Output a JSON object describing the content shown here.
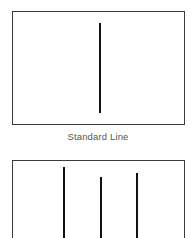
{
  "figure": {
    "width": 196,
    "height": 238,
    "background_color": "#ffffff",
    "line_color": "#111111",
    "frame_color": "#3a3a3c",
    "caption_color": "#555558"
  },
  "panels": [
    {
      "id": "standard",
      "caption": "Standard Line",
      "frame": {
        "x": 12,
        "y": 11,
        "width": 173,
        "height": 114
      },
      "marks": [
        {
          "name": "line-1",
          "x": 98,
          "y_top": 22,
          "y_bottom": 112,
          "thickness": 2
        }
      ]
    },
    {
      "id": "variant",
      "caption": "",
      "frame": {
        "x": 12,
        "y": 160,
        "width": 173,
        "height": 90
      },
      "marks": [
        {
          "name": "line-1",
          "x": 62,
          "y_top": 166,
          "y_bottom": 250,
          "thickness": 2
        },
        {
          "name": "line-2",
          "x": 99,
          "y_top": 176,
          "y_bottom": 250,
          "thickness": 2
        },
        {
          "name": "line-3",
          "x": 135,
          "y_top": 172,
          "y_bottom": 250,
          "thickness": 2
        }
      ]
    }
  ],
  "chart_data": {
    "type": "line",
    "title": "",
    "xlabel": "",
    "ylabel": "",
    "panels": [
      {
        "label": "Standard Line",
        "description": "A single vertical line segment centered in a rectangular frame.",
        "line_count": 1,
        "x": [
          98
        ],
        "y_top": [
          22
        ],
        "y_bottom": [
          112
        ],
        "lengths": [
          90
        ]
      },
      {
        "label": "",
        "description": "Three vertical line segments of staggered top positions inside a rectangular frame, extending past the bottom crop.",
        "line_count": 3,
        "x": [
          62,
          99,
          135
        ],
        "y_top": [
          166,
          176,
          172
        ],
        "y_bottom": [
          250,
          250,
          250
        ],
        "lengths": [
          84,
          74,
          78
        ]
      }
    ],
    "grid": false,
    "legend": null
  }
}
